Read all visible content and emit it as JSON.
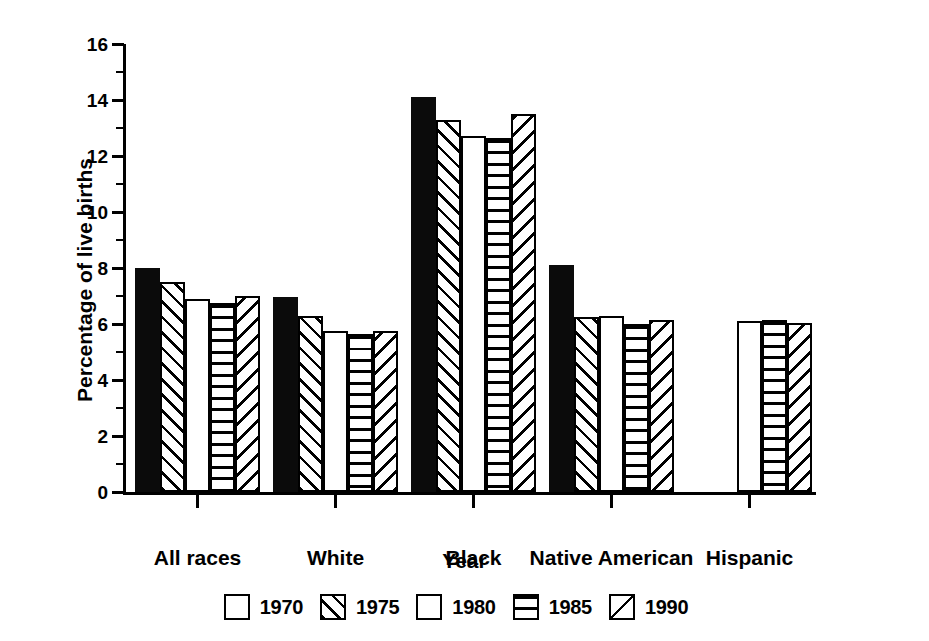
{
  "chart_data": {
    "type": "bar",
    "title": "",
    "xlabel": "Year",
    "ylabel": "Percentage of live births",
    "ylim": [
      0,
      16
    ],
    "ytick_major": [
      0,
      2,
      4,
      6,
      8,
      10,
      12,
      14,
      16
    ],
    "ytick_minor": [
      1,
      3,
      5,
      7,
      9,
      11,
      13,
      15
    ],
    "grid": false,
    "legend_position": "bottom",
    "categories": [
      "All races",
      "White",
      "Black",
      "Native American",
      "Hispanic"
    ],
    "series": [
      {
        "name": "1970",
        "pattern": "solid-black",
        "values": [
          8.0,
          6.95,
          14.1,
          8.1,
          null
        ]
      },
      {
        "name": "1975",
        "pattern": "diagonal-forward",
        "values": [
          7.5,
          6.3,
          13.3,
          6.25,
          null
        ]
      },
      {
        "name": "1980",
        "pattern": "blank-white",
        "values": [
          6.9,
          5.75,
          12.7,
          6.3,
          6.1
        ]
      },
      {
        "name": "1985",
        "pattern": "horizontal-lines",
        "values": [
          6.75,
          5.65,
          12.65,
          6.0,
          6.15
        ]
      },
      {
        "name": "1990",
        "pattern": "diagonal-backward",
        "values": [
          7.0,
          5.75,
          13.5,
          6.15,
          6.05
        ]
      }
    ]
  },
  "axes": {
    "ylabel": "Percentage of live births",
    "xlabel": "Year",
    "ytick_labels": [
      "0",
      "2",
      "4",
      "6",
      "8",
      "10",
      "12",
      "14",
      "16"
    ],
    "xtick_labels": [
      "All races",
      "White",
      "Black",
      "Native American",
      "Hispanic"
    ]
  },
  "legend": {
    "items": [
      {
        "label": "1970",
        "swatch": "solid-black-swatch"
      },
      {
        "label": "1975",
        "swatch": "diagonal-forward-swatch"
      },
      {
        "label": "1980",
        "swatch": "blank-white-swatch"
      },
      {
        "label": "1985",
        "swatch": "horizontal-lines-swatch"
      },
      {
        "label": "1990",
        "swatch": "diagonal-backward-swatch"
      }
    ]
  },
  "colors": {
    "foreground": "#000000",
    "background": "#ffffff"
  }
}
